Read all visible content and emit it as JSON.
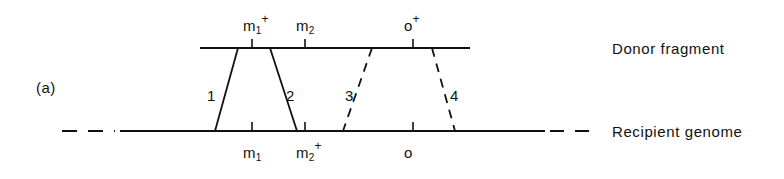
{
  "figure": {
    "panel_label": "(a)",
    "background_color": "#ffffff",
    "line_color": "#111111"
  },
  "captions": {
    "donor": "Donor fragment",
    "recipient": "Recipient genome"
  },
  "donor_markers": [
    {
      "id": "m1-plus",
      "base": "m",
      "sub": "1",
      "sup": "+",
      "x": 252
    },
    {
      "id": "m2",
      "base": "m",
      "sub": "2",
      "sup": "",
      "x": 305
    },
    {
      "id": "o-plus",
      "base": "o",
      "sub": "",
      "sup": "+",
      "x": 413
    }
  ],
  "recipient_markers": [
    {
      "id": "m1",
      "base": "m",
      "sub": "1",
      "sup": "",
      "x": 252
    },
    {
      "id": "m2-plus",
      "base": "m",
      "sub": "2",
      "sup": "+",
      "x": 305
    },
    {
      "id": "o",
      "base": "o",
      "sub": "",
      "sup": "",
      "x": 413
    }
  ],
  "crossovers": [
    {
      "label": "1",
      "style": "solid",
      "top_x": 238,
      "bottom_x": 215,
      "label_x": 207,
      "label_y": 88
    },
    {
      "label": "2",
      "style": "solid",
      "top_x": 270,
      "bottom_x": 297,
      "label_x": 286,
      "label_y": 88
    },
    {
      "label": "3",
      "style": "dashed",
      "top_x": 372,
      "bottom_x": 343,
      "label_x": 345,
      "label_y": 88
    },
    {
      "label": "4",
      "style": "dashed",
      "top_x": 432,
      "bottom_x": 455,
      "label_x": 450,
      "label_y": 88
    }
  ],
  "chart_data": {
    "type": "diagram",
    "donor_line": {
      "y": 48,
      "x_start": 200,
      "x_end": 470,
      "style": "solid"
    },
    "recipient_line": {
      "y": 131,
      "x_start": 62,
      "x_end": 600,
      "solid_span": [
        120,
        545
      ],
      "dashed_left_span": [
        62,
        115
      ],
      "dashed_right_span": [
        550,
        600
      ]
    },
    "tick_height": 9
  }
}
